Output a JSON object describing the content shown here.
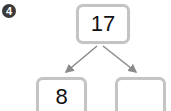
{
  "problem": {
    "number": "4",
    "whole": "17",
    "parts": [
      "8",
      ""
    ]
  },
  "colors": {
    "badge": "#3a3a3a",
    "box_border": "#c4c4c4",
    "arrow": "#8a8a8a"
  }
}
